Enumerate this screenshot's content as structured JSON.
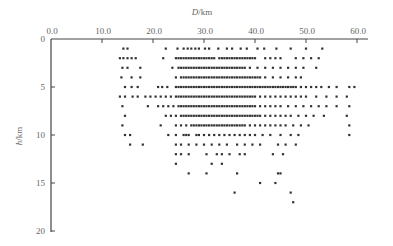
{
  "chart_data": {
    "type": "scatter",
    "title": "",
    "xlabel": "D/km",
    "ylabel": "h/km",
    "x_axis_position": "top",
    "y_axis_inverted": true,
    "xlim": [
      0,
      60
    ],
    "ylim": [
      0,
      20
    ],
    "xticks": [
      "0.0",
      "10.0",
      "20.0",
      "30.0",
      "40.0",
      "50.0",
      "60.0"
    ],
    "yticks": [
      "0",
      "5",
      "10",
      "15",
      "20"
    ],
    "grid": false,
    "legend": null,
    "marker_color": "#333333",
    "axis_color": "#444444",
    "rows": [
      {
        "h": 1,
        "D": [
          14.2,
          15.0,
          22.5,
          24.8,
          26.0,
          26.8,
          27.5,
          28.3,
          29.0,
          30.2,
          31.0,
          32.8,
          34.5,
          35.5,
          37.2,
          38.4,
          40.5,
          41.8,
          44.2,
          47.0,
          50.0,
          53.2
        ]
      },
      {
        "h": 2,
        "D": [
          13.5,
          14.2,
          15.0,
          15.8,
          16.6,
          22.0,
          24.5,
          25.0,
          25.5,
          26.0,
          26.5,
          27.0,
          27.5,
          28.0,
          28.5,
          29.0,
          29.5,
          30.0,
          30.5,
          31.0,
          31.5,
          32.0,
          33.0,
          33.5,
          34.0,
          34.5,
          35.0,
          35.5,
          36.0,
          36.5,
          37.0,
          37.5,
          38.0,
          38.5,
          39.0,
          39.5,
          40.0,
          42.0,
          43.0,
          44.0,
          45.0,
          48.0,
          49.5,
          51.0,
          52.5
        ]
      },
      {
        "h": 3,
        "D": [
          14.0,
          15.0,
          17.5,
          23.8,
          25.0,
          25.5,
          26.0,
          26.5,
          27.0,
          27.5,
          28.0,
          28.5,
          29.0,
          29.5,
          30.0,
          30.5,
          31.0,
          31.5,
          32.0,
          32.5,
          33.0,
          33.5,
          34.0,
          34.5,
          35.0,
          35.5,
          36.0,
          36.5,
          37.0,
          37.5,
          38.0,
          39.0,
          40.5,
          42.0,
          43.5,
          45.0,
          46.5,
          48.0,
          49.5,
          52.0
        ]
      },
      {
        "h": 4,
        "D": [
          13.8,
          15.8,
          17.5,
          24.5,
          25.5,
          26.0,
          26.5,
          27.0,
          27.5,
          28.0,
          28.5,
          29.0,
          29.5,
          30.0,
          30.5,
          31.0,
          31.5,
          32.0,
          32.5,
          33.0,
          33.5,
          34.0,
          34.5,
          35.0,
          35.5,
          36.0,
          36.5,
          37.0,
          37.5,
          38.0,
          38.5,
          39.0,
          39.5,
          40.0,
          40.5,
          41.0,
          42.0,
          43.5,
          45.0,
          46.5,
          48.0,
          49.0
        ]
      },
      {
        "h": 5,
        "D": [
          14.5,
          15.8,
          17.0,
          21.0,
          21.8,
          22.8,
          24.5,
          25.0,
          25.5,
          26.0,
          26.5,
          27.0,
          27.5,
          28.0,
          28.5,
          29.0,
          29.5,
          30.0,
          30.5,
          31.0,
          31.5,
          32.0,
          32.5,
          33.0,
          33.5,
          34.0,
          34.5,
          35.0,
          35.5,
          36.0,
          36.5,
          37.0,
          37.5,
          38.0,
          38.5,
          39.0,
          39.5,
          40.0,
          40.5,
          41.0,
          41.5,
          42.0,
          42.5,
          43.0,
          43.5,
          44.0,
          44.5,
          45.0,
          45.5,
          46.0,
          46.5,
          47.0,
          47.5,
          48.0,
          49.0,
          50.0,
          51.0,
          52.0,
          53.0,
          54.5,
          56.0,
          58.5,
          59.5
        ]
      },
      {
        "h": 6,
        "D": [
          13.5,
          14.5,
          16.0,
          17.0,
          18.5,
          19.5,
          20.5,
          21.5,
          22.5,
          23.5,
          24.5,
          25.0,
          25.5,
          26.0,
          26.5,
          27.0,
          27.5,
          28.0,
          28.5,
          29.0,
          29.5,
          30.0,
          30.5,
          31.0,
          31.5,
          32.0,
          32.5,
          33.0,
          33.5,
          34.0,
          34.5,
          35.0,
          35.5,
          36.0,
          36.5,
          37.0,
          37.5,
          38.0,
          38.5,
          39.0,
          39.5,
          40.0,
          41.0,
          42.0,
          43.0,
          44.0,
          45.0,
          46.0,
          47.0,
          48.0,
          49.0,
          50.0,
          52.0,
          54.0,
          56.0,
          58.0
        ]
      },
      {
        "h": 7,
        "D": [
          14.0,
          19.0,
          21.0,
          22.0,
          23.0,
          24.0,
          25.0,
          25.5,
          26.0,
          26.5,
          27.0,
          27.5,
          28.0,
          28.5,
          29.0,
          29.5,
          30.0,
          30.5,
          31.0,
          31.5,
          32.0,
          32.5,
          33.0,
          33.5,
          34.0,
          34.5,
          35.0,
          35.5,
          36.0,
          36.5,
          37.0,
          37.5,
          38.0,
          38.5,
          39.0,
          39.5,
          40.0,
          41.0,
          42.0,
          43.0,
          44.0,
          45.0,
          46.5,
          48.0,
          49.5,
          51.0,
          52.5,
          54.0,
          56.0,
          58.5
        ]
      },
      {
        "h": 8,
        "D": [
          14.5,
          22.5,
          23.5,
          24.5,
          25.5,
          26.0,
          26.5,
          27.0,
          27.5,
          28.0,
          28.5,
          29.0,
          29.5,
          30.0,
          30.5,
          31.0,
          31.5,
          32.0,
          32.5,
          33.0,
          33.5,
          34.0,
          34.5,
          35.0,
          35.5,
          36.0,
          36.5,
          37.0,
          37.5,
          38.0,
          38.5,
          39.0,
          39.5,
          40.0,
          40.5,
          41.0,
          42.0,
          43.0,
          44.0,
          45.0,
          46.0,
          47.0,
          48.5,
          50.0,
          51.5,
          53.5,
          58.0
        ]
      },
      {
        "h": 9,
        "D": [
          14.0,
          21.5,
          24.5,
          25.5,
          26.5,
          27.5,
          28.0,
          28.5,
          29.0,
          29.5,
          30.0,
          30.5,
          31.0,
          31.5,
          32.0,
          32.5,
          33.0,
          33.5,
          34.0,
          34.5,
          35.0,
          35.5,
          36.0,
          36.5,
          37.0,
          37.5,
          38.0,
          39.0,
          40.0,
          41.0,
          42.0,
          43.0,
          44.0,
          45.0,
          46.0,
          47.5,
          49.0,
          50.5,
          58.5
        ]
      },
      {
        "h": 10,
        "D": [
          14.5,
          15.5,
          23.0,
          24.5,
          26.0,
          26.5,
          27.0,
          28.5,
          29.0,
          30.0,
          31.0,
          32.0,
          33.0,
          34.0,
          35.0,
          36.0,
          37.0,
          38.0,
          39.0,
          40.0,
          41.5,
          43.0,
          45.0,
          47.0,
          48.5,
          58.5
        ]
      },
      {
        "h": 11,
        "D": [
          15.5,
          18.0,
          24.5,
          25.5,
          27.0,
          28.5,
          30.0,
          31.5,
          33.0,
          34.5,
          36.5,
          38.0,
          39.5,
          41.0,
          44.5,
          46.0,
          48.0
        ]
      },
      {
        "h": 12,
        "D": [
          24.5,
          25.5,
          27.0,
          30.5,
          32.5,
          33.5,
          35.0,
          37.0,
          38.0,
          43.5,
          45.5
        ]
      },
      {
        "h": 13,
        "D": [
          24.5,
          31.5,
          33.5
        ]
      },
      {
        "h": 14,
        "D": [
          27.0,
          30.5,
          36.5,
          44.5,
          45.0
        ]
      },
      {
        "h": 15,
        "D": [
          41.0,
          44.0
        ]
      },
      {
        "h": 16,
        "D": [
          36.0,
          47.0
        ]
      },
      {
        "h": 17,
        "D": [
          47.5
        ]
      }
    ]
  }
}
